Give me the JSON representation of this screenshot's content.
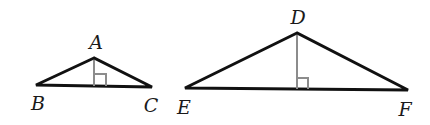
{
  "diagram": {
    "type": "similar-triangles",
    "colors": {
      "side": "#111111",
      "altitude": "#8c8c8c",
      "label": "#1a1a1a",
      "background": "#ffffff"
    },
    "triangles": [
      {
        "name": "ABC",
        "vertices": {
          "A": {
            "label": "A",
            "x": 94,
            "y": 58,
            "label_x": 96,
            "label_y": 49
          },
          "B": {
            "label": "B",
            "x": 36,
            "y": 85,
            "label_x": 38,
            "label_y": 110
          },
          "C": {
            "label": "C",
            "x": 152,
            "y": 87,
            "label_x": 151,
            "label_y": 112
          }
        },
        "altitude": {
          "from": "A",
          "foot_x": 94,
          "foot_y": 86,
          "right_angle_size": 12
        }
      },
      {
        "name": "DEF",
        "vertices": {
          "D": {
            "label": "D",
            "x": 297,
            "y": 33,
            "label_x": 298,
            "label_y": 24
          },
          "E": {
            "label": "E",
            "x": 185,
            "y": 88,
            "label_x": 184,
            "label_y": 114
          },
          "F": {
            "label": "F",
            "x": 408,
            "y": 90,
            "label_x": 405,
            "label_y": 116
          }
        },
        "altitude": {
          "from": "D",
          "foot_x": 297,
          "foot_y": 89,
          "right_angle_size": 11
        }
      }
    ]
  }
}
